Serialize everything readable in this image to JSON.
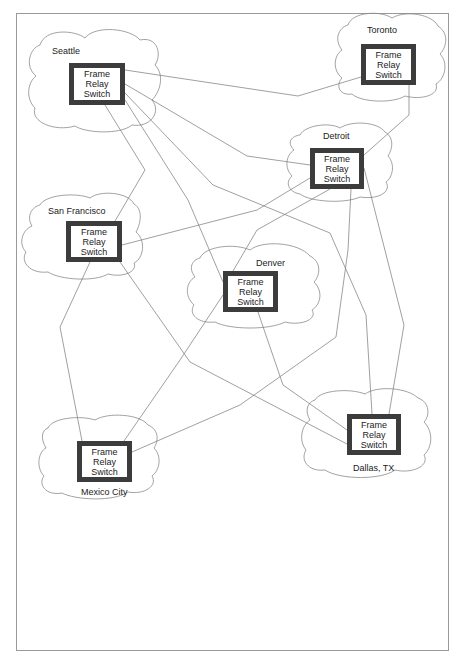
{
  "diagram": {
    "switch_label_lines": [
      "Frame",
      "Relay",
      "Switch"
    ],
    "nodes": [
      {
        "id": "seattle",
        "city": "Seattle"
      },
      {
        "id": "toronto",
        "city": "Toronto"
      },
      {
        "id": "detroit",
        "city": "Detroit"
      },
      {
        "id": "san_francisco",
        "city": "San Francisco"
      },
      {
        "id": "denver",
        "city": "Denver"
      },
      {
        "id": "dallas",
        "city": "Dallas, TX"
      },
      {
        "id": "mexico_city",
        "city": "Mexico City"
      }
    ],
    "links": [
      [
        "seattle",
        "toronto"
      ],
      [
        "seattle",
        "detroit"
      ],
      [
        "seattle",
        "dallas"
      ],
      [
        "seattle",
        "denver"
      ],
      [
        "seattle",
        "san_francisco"
      ],
      [
        "toronto",
        "detroit"
      ],
      [
        "detroit",
        "san_francisco"
      ],
      [
        "detroit",
        "denver"
      ],
      [
        "detroit",
        "mexico_city"
      ],
      [
        "detroit",
        "dallas"
      ],
      [
        "san_francisco",
        "mexico_city"
      ],
      [
        "san_francisco",
        "dallas"
      ],
      [
        "denver",
        "mexico_city"
      ],
      [
        "denver",
        "dallas"
      ]
    ],
    "colors": {
      "switch_border": "#3c3c3c",
      "line": "#777777",
      "cloud": "#888888"
    }
  }
}
